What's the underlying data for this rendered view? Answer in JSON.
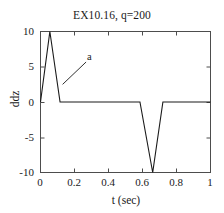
{
  "chart_data": {
    "type": "line",
    "title": "EX10.16, q=200",
    "xlabel": "t (sec)",
    "ylabel": "ddz",
    "xlim": [
      0,
      1
    ],
    "ylim": [
      -10,
      10
    ],
    "xticks": [
      0,
      0.2,
      0.4,
      0.6,
      0.8,
      1
    ],
    "xticklabels": [
      "0",
      "0.2",
      "0.4",
      "0.6",
      "0.8",
      "1"
    ],
    "yticks": [
      -10,
      -5,
      0,
      5,
      10
    ],
    "yticklabels": [
      "-10",
      "-5",
      "0",
      "5",
      "10"
    ],
    "grid": false,
    "legend": null,
    "box": true,
    "series": [
      {
        "name": "a",
        "color": "#1a1a1a",
        "x": [
          0,
          0.055,
          0.115,
          0.585,
          0.66,
          0.72,
          1
        ],
        "y": [
          0,
          10,
          0,
          0,
          -10,
          0,
          0
        ]
      }
    ],
    "annotations": [
      {
        "text": "a",
        "label_x": 0.28,
        "label_y": 6.1,
        "target_x": 0.13,
        "target_y": 2.5
      }
    ]
  },
  "axis_labels": {
    "title": "EX10.16, q=200",
    "x": "t (sec)",
    "y": "ddz"
  },
  "colors": {
    "line": "#1a1a1a",
    "axis": "#4d4d4d",
    "text": "#1a1a1a",
    "background": "#ffffff"
  }
}
